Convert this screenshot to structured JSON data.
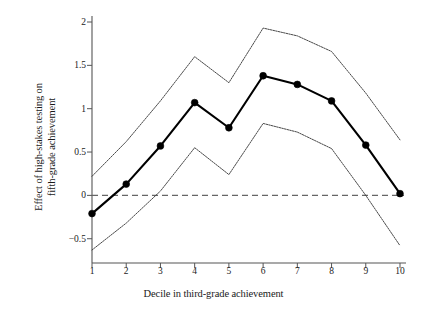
{
  "chart_data": {
    "type": "line",
    "title": "",
    "xlabel": "Decile in third-grade achievement",
    "ylabel": "Effect of high-stakes testing on fifth-grade achievement",
    "ylabel_line1": "Effect of high-stakes testing on",
    "ylabel_line2": "fifth-grade achievement",
    "categories": [
      1,
      2,
      3,
      4,
      5,
      6,
      7,
      8,
      9,
      10
    ],
    "x_tick_labels": [
      "1",
      "2",
      "3",
      "4",
      "5",
      "6",
      "7",
      "8",
      "9",
      "10"
    ],
    "y_tick_labels": [
      "2",
      "1.5",
      "1",
      "0.5",
      "0",
      "−0.5"
    ],
    "y_tick_values": [
      2,
      1.5,
      1,
      0.5,
      0,
      -0.5
    ],
    "xlim": [
      1,
      10
    ],
    "ylim": [
      -0.78,
      2.1
    ],
    "grid": false,
    "legend": "none",
    "zero_reference_line": 0,
    "series": [
      {
        "name": "Point estimate",
        "style": "solid-with-markers",
        "color": "#000000",
        "values": [
          -0.21,
          0.13,
          0.57,
          1.07,
          0.78,
          1.38,
          1.28,
          1.09,
          0.58,
          0.02
        ]
      },
      {
        "name": "Upper confidence bound",
        "style": "thin-dotted",
        "color": "#333333",
        "values": [
          0.22,
          0.62,
          1.09,
          1.6,
          1.3,
          1.93,
          1.84,
          1.66,
          1.18,
          0.64
        ]
      },
      {
        "name": "Lower confidence bound",
        "style": "thin-dotted",
        "color": "#333333",
        "values": [
          -0.63,
          -0.32,
          0.05,
          0.55,
          0.24,
          0.83,
          0.73,
          0.54,
          0.0,
          -0.58
        ]
      }
    ],
    "annotations": []
  },
  "axes": {
    "y_axis_name": "y-axis",
    "x_axis_name": "x-axis"
  }
}
